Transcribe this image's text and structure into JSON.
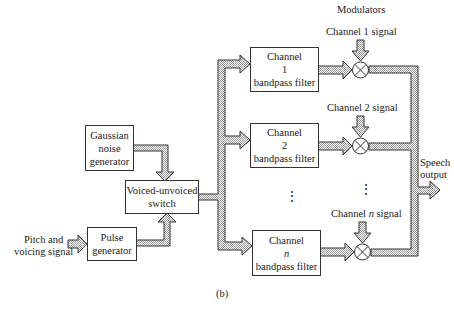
{
  "figure": {
    "caption": "(b)",
    "heading": "Modulators",
    "blocks": {
      "gaussian": [
        "Gaussian",
        "noise",
        "generator"
      ],
      "switch": [
        "Voiced-unvoiced",
        "switch"
      ],
      "pulse": [
        "Pulse",
        "generator"
      ],
      "filter1": [
        "Channel",
        "1",
        "bandpass filter"
      ],
      "filter2": [
        "Channel",
        "2",
        "bandpass filter"
      ],
      "filtern": [
        "Channel",
        "n",
        "bandpass filter"
      ]
    },
    "labels": {
      "input": [
        "Pitch and",
        "voicing signal"
      ],
      "ch1_signal": "Channel 1 signal",
      "ch2_signal": "Channel 2 signal",
      "chn_signal": "Channel n signal",
      "output": [
        "Speech",
        "output"
      ],
      "ellipsis": "⋮"
    }
  }
}
